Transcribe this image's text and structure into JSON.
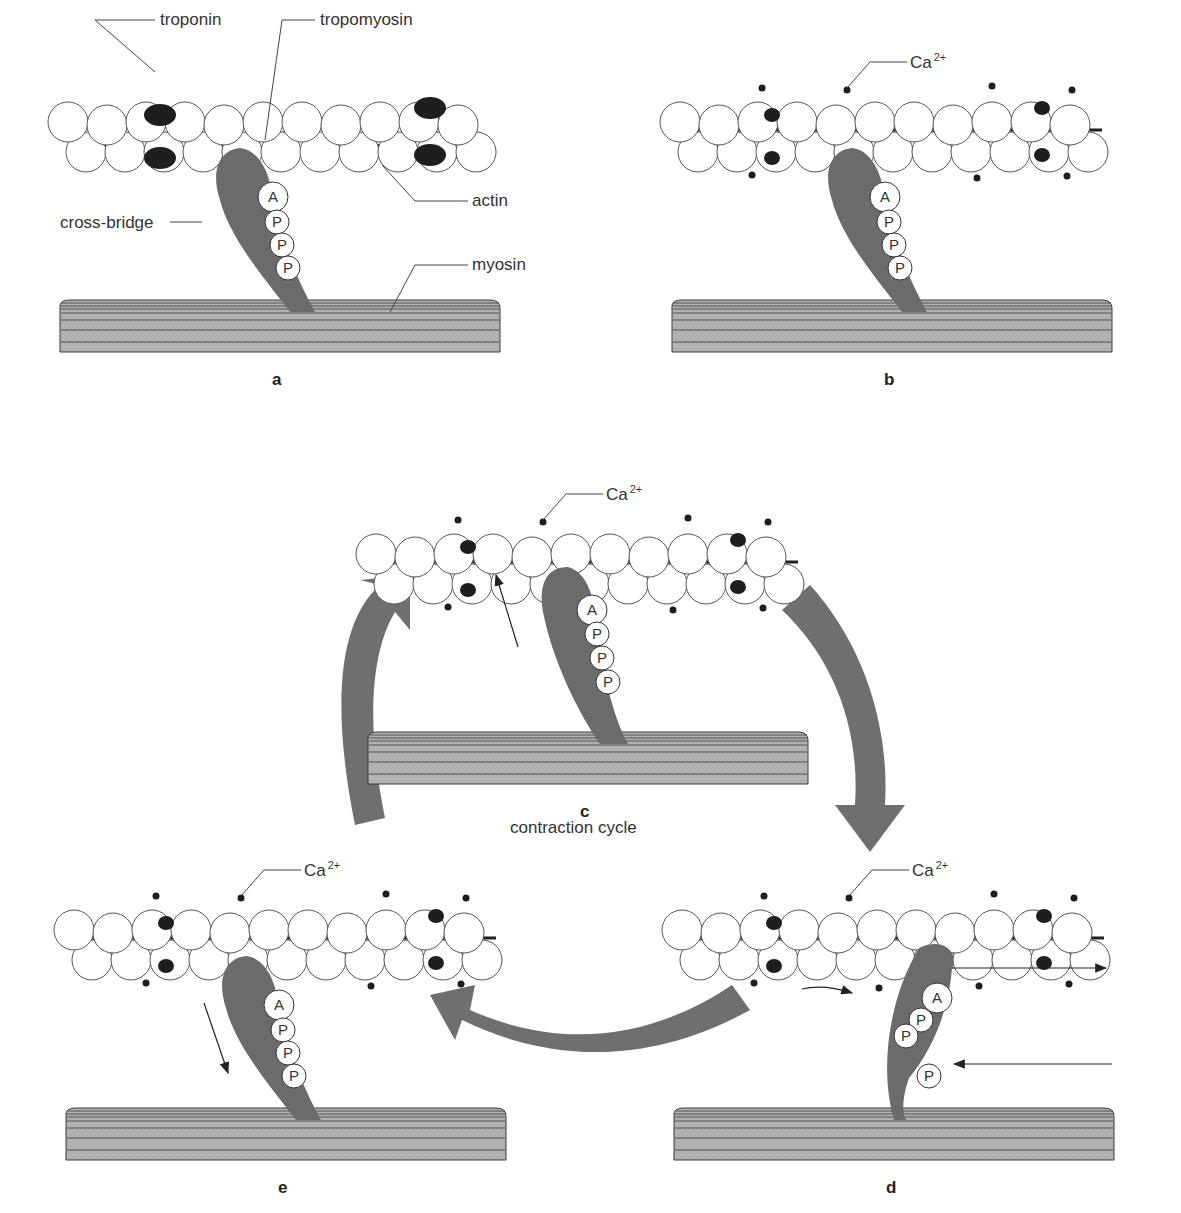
{
  "figure": {
    "title": "contraction cycle",
    "colors": {
      "background": "#ffffff",
      "cross_bridge": "#6b6b6b",
      "cycle_arrow": "#6f6f6f",
      "myosin_fill": "#b4b4b4",
      "myosin_lines": "#3a3a3a",
      "actin_fill": "#ffffff",
      "actin_stroke": "#555555",
      "troponin": "#1e1e1e",
      "calcium": "#1e1e1e"
    },
    "labels": {
      "troponin": "troponin",
      "tropomyosin": "tropomyosin",
      "actin": "actin",
      "cross_bridge": "cross-bridge",
      "myosin": "myosin",
      "calcium": "Ca",
      "calcium_charge": "2+",
      "atp_adenosine": "A",
      "atp_phosphate": "P",
      "cycle": "contraction cycle"
    },
    "panels": [
      {
        "id": "a",
        "letter": "a",
        "x": 60,
        "y": 0,
        "calcium": false,
        "bound": false,
        "arrow": "none",
        "phosphate_released": false
      },
      {
        "id": "b",
        "letter": "b",
        "x": 672,
        "y": 0,
        "calcium": true,
        "bound": false,
        "arrow": "none",
        "phosphate_released": false
      },
      {
        "id": "c",
        "letter": "c",
        "x": 368,
        "y": 432,
        "calcium": true,
        "bound": true,
        "arrow": "up",
        "phosphate_released": false
      },
      {
        "id": "d",
        "letter": "d",
        "x": 674,
        "y": 808,
        "calcium": true,
        "bound": true,
        "arrow": "power",
        "phosphate_released": true
      },
      {
        "id": "e",
        "letter": "e",
        "x": 66,
        "y": 808,
        "calcium": true,
        "bound": false,
        "arrow": "down",
        "phosphate_released": false
      }
    ],
    "cycle_arrows": [
      {
        "name": "arrow-c-to-d",
        "from": "c",
        "to": "d"
      },
      {
        "name": "arrow-d-to-e",
        "from": "d",
        "to": "e"
      },
      {
        "name": "arrow-e-to-c",
        "from": "e",
        "to": "c"
      }
    ]
  }
}
